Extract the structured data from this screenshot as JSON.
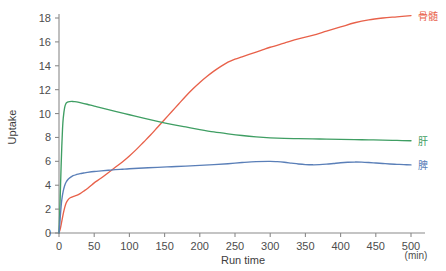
{
  "chart_data": {
    "type": "line",
    "title": "",
    "subtitle": "",
    "xlabel": "Run time",
    "xunit": "(min)",
    "ylabel": "Uptake",
    "xlim": [
      0,
      500
    ],
    "ylim": [
      0,
      18
    ],
    "xticks": [
      0,
      50,
      100,
      150,
      200,
      250,
      300,
      350,
      400,
      450,
      500
    ],
    "yticks": [
      0,
      2,
      4,
      6,
      8,
      10,
      12,
      14,
      16,
      18
    ],
    "xtick_labels": [
      "0",
      "50",
      "100",
      "150",
      "200",
      "250",
      "300",
      "350",
      "400",
      "450",
      "500"
    ],
    "ytick_labels": [
      "0",
      "2",
      "4",
      "6",
      "8",
      "10",
      "12",
      "14",
      "16",
      "18"
    ],
    "grid": false,
    "legend_position": "right-inline-end-labels",
    "series": [
      {
        "name": "骨髄",
        "label": "骨髄",
        "color": "#e8614a",
        "end_label_value": 18.2,
        "x": [
          0,
          2,
          4,
          6,
          8,
          10,
          13,
          16,
          20,
          25,
          30,
          35,
          40,
          45,
          50,
          60,
          70,
          80,
          90,
          100,
          110,
          120,
          130,
          140,
          150,
          160,
          170,
          180,
          190,
          200,
          210,
          220,
          230,
          240,
          250,
          260,
          270,
          280,
          290,
          300,
          320,
          340,
          360,
          380,
          400,
          420,
          440,
          460,
          480,
          500
        ],
        "values": [
          0,
          0.4,
          1.0,
          1.6,
          2.1,
          2.5,
          2.8,
          2.95,
          3.05,
          3.15,
          3.3,
          3.5,
          3.7,
          3.95,
          4.2,
          4.6,
          5.05,
          5.5,
          5.95,
          6.45,
          7.0,
          7.6,
          8.2,
          8.85,
          9.5,
          10.15,
          10.8,
          11.45,
          12.05,
          12.6,
          13.1,
          13.55,
          13.95,
          14.3,
          14.55,
          14.75,
          14.95,
          15.15,
          15.35,
          15.55,
          15.9,
          16.25,
          16.55,
          16.9,
          17.25,
          17.6,
          17.85,
          18.0,
          18.1,
          18.2
        ]
      },
      {
        "name": "肝",
        "label": "肝",
        "color": "#3f9e63",
        "end_label_value": 7.7,
        "x": [
          0,
          1,
          2,
          3,
          4,
          5,
          6,
          8,
          10,
          12,
          15,
          18,
          21,
          25,
          30,
          40,
          50,
          60,
          80,
          100,
          120,
          140,
          160,
          180,
          200,
          220,
          240,
          260,
          280,
          300,
          320,
          340,
          360,
          380,
          400,
          420,
          440,
          460,
          480,
          500
        ],
        "values": [
          0,
          1.6,
          3.6,
          5.6,
          7.3,
          8.7,
          9.6,
          10.5,
          10.85,
          10.95,
          11.0,
          11.02,
          11.0,
          10.98,
          10.92,
          10.78,
          10.62,
          10.48,
          10.18,
          9.9,
          9.62,
          9.35,
          9.1,
          8.88,
          8.66,
          8.46,
          8.3,
          8.16,
          8.05,
          7.97,
          7.92,
          7.9,
          7.88,
          7.86,
          7.84,
          7.82,
          7.8,
          7.78,
          7.75,
          7.72
        ]
      },
      {
        "name": "脾",
        "label": "脾",
        "color": "#5a7fb8",
        "end_label_value": 5.7,
        "x": [
          0,
          1,
          2,
          3,
          4,
          6,
          8,
          10,
          13,
          16,
          20,
          25,
          30,
          35,
          40,
          50,
          60,
          70,
          80,
          90,
          100,
          120,
          140,
          160,
          180,
          200,
          220,
          240,
          260,
          280,
          300,
          310,
          320,
          330,
          340,
          350,
          360,
          370,
          380,
          390,
          400,
          410,
          420,
          430,
          440,
          450,
          460,
          470,
          480,
          490,
          500
        ],
        "values": [
          0,
          0.7,
          1.5,
          2.2,
          2.8,
          3.5,
          3.95,
          4.25,
          4.5,
          4.65,
          4.8,
          4.9,
          4.97,
          5.02,
          5.07,
          5.15,
          5.2,
          5.25,
          5.3,
          5.34,
          5.38,
          5.44,
          5.5,
          5.55,
          5.6,
          5.66,
          5.72,
          5.8,
          5.9,
          5.98,
          6.0,
          5.97,
          5.92,
          5.85,
          5.78,
          5.73,
          5.71,
          5.72,
          5.76,
          5.82,
          5.88,
          5.92,
          5.94,
          5.93,
          5.9,
          5.86,
          5.82,
          5.78,
          5.75,
          5.72,
          5.7
        ]
      }
    ]
  },
  "axes": {
    "y_title": "Uptake",
    "x_title": "Run time",
    "x_unit": "(min)"
  }
}
